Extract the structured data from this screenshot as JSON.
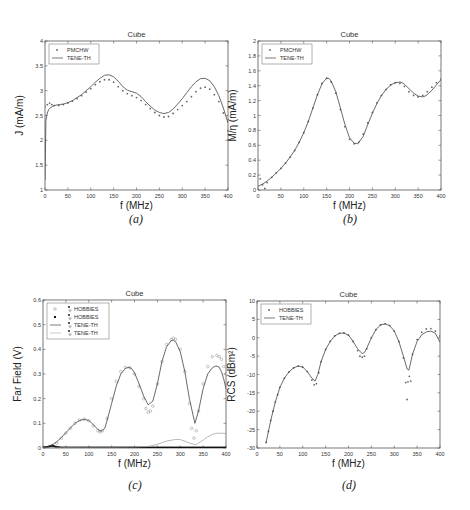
{
  "captions": [
    "(a)",
    "(b)",
    "(c)",
    "(d)"
  ],
  "chart_data": [
    {
      "id": "a",
      "type": "line",
      "title": "Cube",
      "xlabel": "f (MHz)",
      "ylabel": "J (mA/m)",
      "xlim": [
        0,
        400
      ],
      "ylim": [
        1,
        4
      ],
      "xticks": [
        0,
        50,
        100,
        150,
        200,
        250,
        300,
        350,
        400
      ],
      "yticks": [
        1,
        1.5,
        2,
        2.5,
        3,
        3.5,
        4
      ],
      "ytick_labels": [
        "1",
        "1.5",
        "2",
        "2.5",
        "3",
        "3.5",
        "4"
      ],
      "grid": false,
      "legend": {
        "position": "upper-left",
        "entries": [
          "PMCHW",
          "TENE-TH"
        ]
      },
      "series": [
        {
          "name": "PMCHW",
          "style": "markers",
          "x": [
            0,
            5,
            10,
            15,
            20,
            30,
            40,
            50,
            60,
            70,
            80,
            90,
            100,
            110,
            120,
            130,
            140,
            150,
            160,
            170,
            180,
            190,
            200,
            210,
            220,
            230,
            240,
            250,
            260,
            270,
            280,
            290,
            300,
            310,
            320,
            330,
            340,
            350,
            360,
            370,
            380,
            390,
            400
          ],
          "y": [
            2.68,
            2.72,
            2.75,
            2.72,
            2.7,
            2.7,
            2.72,
            2.75,
            2.79,
            2.84,
            2.9,
            2.97,
            3.04,
            3.12,
            3.18,
            3.22,
            3.22,
            3.17,
            3.08,
            3.0,
            2.94,
            2.9,
            2.86,
            2.8,
            2.72,
            2.64,
            2.56,
            2.5,
            2.47,
            2.48,
            2.54,
            2.62,
            2.7,
            2.78,
            2.88,
            2.98,
            3.05,
            3.07,
            3.03,
            2.92,
            2.78,
            2.55,
            2.2
          ]
        },
        {
          "name": "TENE-TH",
          "style": "line",
          "x": [
            0,
            2,
            5,
            8,
            12,
            16,
            20,
            30,
            40,
            50,
            60,
            70,
            80,
            90,
            100,
            110,
            120,
            130,
            140,
            150,
            160,
            170,
            180,
            190,
            200,
            210,
            220,
            230,
            240,
            250,
            260,
            270,
            280,
            290,
            300,
            310,
            320,
            330,
            340,
            350,
            360,
            370,
            380,
            390,
            400
          ],
          "y": [
            1.2,
            2.4,
            2.55,
            2.62,
            2.66,
            2.68,
            2.7,
            2.72,
            2.73,
            2.76,
            2.8,
            2.86,
            2.92,
            3.0,
            3.08,
            3.17,
            3.25,
            3.31,
            3.32,
            3.28,
            3.19,
            3.08,
            3.01,
            2.98,
            2.95,
            2.88,
            2.78,
            2.69,
            2.61,
            2.56,
            2.54,
            2.56,
            2.63,
            2.73,
            2.84,
            2.96,
            3.08,
            3.18,
            3.24,
            3.25,
            3.2,
            3.08,
            2.9,
            2.65,
            2.35
          ]
        }
      ]
    },
    {
      "id": "b",
      "type": "line",
      "title": "Cube",
      "xlabel": "f (MHz)",
      "ylabel": "M/η (mA/m)",
      "xlim": [
        0,
        400
      ],
      "ylim": [
        0,
        2
      ],
      "xticks": [
        0,
        50,
        100,
        150,
        200,
        250,
        300,
        350,
        400
      ],
      "yticks": [
        0,
        0.2,
        0.4,
        0.6,
        0.8,
        1,
        1.2,
        1.4,
        1.6,
        1.8,
        2
      ],
      "ytick_labels": [
        "0",
        "0.2",
        "0.4",
        "0.6",
        "0.8",
        "1",
        "1.2",
        "1.4",
        "1.6",
        "1.8",
        "2"
      ],
      "grid": false,
      "legend": {
        "position": "upper-left",
        "entries": [
          "PMCHW",
          "TENE-TH"
        ]
      },
      "series": [
        {
          "name": "PMCHW",
          "style": "markers",
          "x": [
            5,
            10,
            15,
            20,
            30,
            40,
            50,
            60,
            70,
            80,
            90,
            100,
            110,
            120,
            130,
            140,
            150,
            160,
            170,
            180,
            190,
            200,
            210,
            220,
            230,
            240,
            250,
            260,
            270,
            280,
            290,
            300,
            310,
            320,
            330,
            340,
            350,
            360,
            370,
            380,
            390,
            400
          ],
          "y": [
            0.15,
            0.07,
            0.02,
            0.1,
            0.17,
            0.23,
            0.29,
            0.36,
            0.44,
            0.53,
            0.64,
            0.77,
            0.92,
            1.1,
            1.28,
            1.43,
            1.5,
            1.45,
            1.3,
            1.08,
            0.85,
            0.68,
            0.62,
            0.64,
            0.75,
            0.9,
            1.04,
            1.17,
            1.27,
            1.35,
            1.41,
            1.44,
            1.43,
            1.39,
            1.32,
            1.27,
            1.25,
            1.27,
            1.32,
            1.38,
            1.44,
            1.49
          ]
        },
        {
          "name": "TENE-TH",
          "style": "line",
          "x": [
            0,
            10,
            20,
            30,
            40,
            50,
            60,
            70,
            80,
            90,
            100,
            110,
            120,
            130,
            140,
            150,
            155,
            160,
            170,
            180,
            190,
            200,
            210,
            218,
            230,
            240,
            250,
            260,
            270,
            280,
            290,
            300,
            310,
            315,
            320,
            330,
            340,
            350,
            360,
            365,
            370,
            380,
            390,
            400
          ],
          "y": [
            0.05,
            0.08,
            0.12,
            0.17,
            0.23,
            0.29,
            0.36,
            0.44,
            0.53,
            0.64,
            0.77,
            0.92,
            1.1,
            1.28,
            1.43,
            1.5,
            1.5,
            1.46,
            1.32,
            1.1,
            0.88,
            0.7,
            0.63,
            0.62,
            0.72,
            0.88,
            1.03,
            1.16,
            1.27,
            1.35,
            1.41,
            1.44,
            1.45,
            1.44,
            1.42,
            1.36,
            1.3,
            1.26,
            1.25,
            1.26,
            1.28,
            1.34,
            1.41,
            1.48
          ]
        }
      ]
    },
    {
      "id": "c",
      "type": "line",
      "title": "Cube",
      "xlabel": "f (MHz)",
      "ylabel": "Far Field (V)",
      "xlim": [
        0,
        400
      ],
      "ylim": [
        0,
        0.6
      ],
      "xticks": [
        0,
        50,
        100,
        150,
        200,
        250,
        300,
        350,
        400
      ],
      "yticks": [
        0,
        0.1,
        0.2,
        0.3,
        0.4,
        0.5,
        0.6
      ],
      "ytick_labels": [
        "0",
        "0.1",
        "0.2",
        "0.3",
        "0.4",
        "0.5",
        "0.6"
      ],
      "grid": false,
      "legend": {
        "position": "upper-left",
        "entries": [
          "HOBBIES",
          "HOBBIES",
          "TENE-TH",
          "TENE-TH"
        ]
      },
      "series": [
        {
          "name": "HOBBIES",
          "style": "open-markers",
          "x": [
            10,
            20,
            30,
            40,
            50,
            60,
            70,
            80,
            90,
            100,
            110,
            120,
            125,
            130,
            140,
            150,
            160,
            170,
            180,
            190,
            200,
            210,
            220,
            225,
            230,
            235,
            240,
            250,
            260,
            270,
            280,
            285,
            290,
            300,
            310,
            320,
            325,
            330,
            335,
            340,
            350,
            360,
            370,
            380,
            385,
            390,
            395,
            400
          ],
          "y": [
            0.0,
            0.01,
            0.02,
            0.04,
            0.06,
            0.08,
            0.1,
            0.113,
            0.117,
            0.11,
            0.09,
            0.07,
            0.065,
            0.07,
            0.12,
            0.2,
            0.27,
            0.31,
            0.327,
            0.325,
            0.3,
            0.25,
            0.2,
            0.16,
            0.145,
            0.15,
            0.17,
            0.26,
            0.35,
            0.42,
            0.44,
            0.445,
            0.44,
            0.4,
            0.31,
            0.18,
            0.08,
            0.04,
            0.07,
            0.15,
            0.26,
            0.33,
            0.37,
            0.375,
            0.37,
            0.36,
            0.33,
            0.3
          ]
        },
        {
          "name": "HOBBIES",
          "style": "filled-markers",
          "x": [
            0,
            10,
            20,
            30,
            40,
            50,
            60,
            70,
            80,
            90,
            100,
            110,
            120,
            130,
            140,
            150,
            160,
            170,
            180,
            190,
            200,
            210,
            220,
            230,
            240,
            250,
            260,
            270,
            280,
            290,
            300,
            310,
            320,
            330,
            340,
            350,
            360,
            370,
            380,
            390,
            400
          ],
          "y": [
            0.0,
            0.003,
            0.008,
            0.002,
            0.0,
            0.0,
            0.0,
            0.0,
            0.0,
            0.0,
            0.0,
            0.0,
            0.0,
            0.0,
            0.0,
            0.0,
            0.0,
            0.0,
            0.0,
            0.0,
            0.0,
            0.0,
            0.0,
            0.0,
            0.0,
            0.0,
            0.0,
            0.0,
            0.0,
            0.0,
            0.0,
            0.0,
            0.0,
            0.0,
            0.0,
            0.0,
            0.0,
            0.0,
            0.0,
            0.0,
            0.0
          ]
        },
        {
          "name": "TENE-TH",
          "style": "line",
          "x": [
            0,
            10,
            20,
            30,
            40,
            50,
            60,
            70,
            80,
            90,
            100,
            110,
            120,
            127,
            135,
            140,
            150,
            160,
            170,
            180,
            188,
            195,
            200,
            210,
            220,
            230,
            240,
            250,
            260,
            270,
            280,
            285,
            290,
            300,
            310,
            320,
            332,
            340,
            350,
            360,
            370,
            378,
            385,
            390,
            395,
            400
          ],
          "y": [
            0.0,
            0.005,
            0.012,
            0.025,
            0.042,
            0.062,
            0.082,
            0.1,
            0.112,
            0.116,
            0.112,
            0.095,
            0.075,
            0.068,
            0.08,
            0.11,
            0.18,
            0.25,
            0.3,
            0.323,
            0.327,
            0.32,
            0.305,
            0.26,
            0.21,
            0.175,
            0.19,
            0.26,
            0.35,
            0.41,
            0.435,
            0.437,
            0.43,
            0.39,
            0.31,
            0.2,
            0.1,
            0.15,
            0.24,
            0.3,
            0.325,
            0.333,
            0.328,
            0.31,
            0.28,
            0.24
          ]
        },
        {
          "name": "TENE-TH",
          "style": "thin-line",
          "x": [
            0,
            50,
            100,
            150,
            200,
            230,
            250,
            270,
            290,
            300,
            310,
            320,
            330,
            335,
            340,
            350,
            360,
            370,
            380,
            390,
            400
          ],
          "y": [
            0.0,
            0.002,
            0.003,
            0.003,
            0.004,
            0.006,
            0.015,
            0.028,
            0.035,
            0.034,
            0.028,
            0.02,
            0.015,
            0.014,
            0.02,
            0.032,
            0.045,
            0.055,
            0.06,
            0.06,
            0.058
          ]
        }
      ]
    },
    {
      "id": "d",
      "type": "line",
      "title": "Cube",
      "xlabel": "f (MHz)",
      "ylabel": "RCS (dBm²)",
      "xlim": [
        0,
        400
      ],
      "ylim": [
        -30,
        10
      ],
      "xticks": [
        0,
        50,
        100,
        150,
        200,
        250,
        300,
        350,
        400
      ],
      "yticks": [
        -30,
        -25,
        -20,
        -15,
        -10,
        -5,
        0,
        5,
        10
      ],
      "ytick_labels": [
        "-30",
        "-25",
        "-20",
        "-15",
        "-10",
        "-5",
        "0",
        "5",
        "10"
      ],
      "grid": false,
      "legend": {
        "position": "upper-left",
        "entries": [
          "HOBBIES",
          "TENE-TH"
        ]
      },
      "series": [
        {
          "name": "HOBBIES",
          "style": "markers",
          "x": [
            20,
            25,
            30,
            35,
            40,
            45,
            50,
            60,
            70,
            80,
            90,
            100,
            110,
            120,
            125,
            130,
            135,
            140,
            150,
            160,
            170,
            180,
            190,
            200,
            210,
            220,
            225,
            230,
            235,
            240,
            250,
            260,
            270,
            280,
            290,
            300,
            310,
            320,
            325,
            328,
            330,
            333,
            336,
            340,
            350,
            360,
            370,
            380,
            390,
            400
          ],
          "y": [
            -28.5,
            -25.5,
            -22.5,
            -20,
            -17.5,
            -15.5,
            -13.5,
            -11,
            -9.3,
            -8.2,
            -7.7,
            -8,
            -9.2,
            -11.5,
            -12.8,
            -12.5,
            -9.5,
            -6.5,
            -3.2,
            -1.0,
            0.5,
            1.2,
            1.3,
            0.7,
            -1.0,
            -3.5,
            -5.0,
            -5.3,
            -5.0,
            -3.0,
            0.0,
            2.2,
            3.5,
            3.8,
            3.3,
            1.8,
            -1.0,
            -5.5,
            -12.2,
            -16.8,
            -12.0,
            -10.5,
            -11.8,
            -4.5,
            -0.5,
            1.5,
            2.4,
            2.5,
            1.8,
            0.5
          ]
        },
        {
          "name": "TENE-TH",
          "style": "line",
          "x": [
            20,
            25,
            30,
            35,
            40,
            45,
            50,
            60,
            70,
            80,
            90,
            100,
            110,
            120,
            127,
            133,
            140,
            150,
            160,
            170,
            180,
            190,
            200,
            210,
            220,
            230,
            235,
            240,
            250,
            260,
            270,
            280,
            290,
            300,
            310,
            320,
            328,
            332,
            340,
            350,
            360,
            370,
            380,
            390,
            400
          ],
          "y": [
            -28.5,
            -25.5,
            -22.5,
            -20,
            -17.5,
            -15.5,
            -13.5,
            -11,
            -9.3,
            -8.2,
            -7.7,
            -8,
            -9.2,
            -11,
            -11.8,
            -10,
            -6.5,
            -3.2,
            -1.0,
            0.5,
            1.2,
            1.3,
            0.7,
            -1.0,
            -3.0,
            -4.3,
            -4.0,
            -2.8,
            0.0,
            2.2,
            3.5,
            3.8,
            3.3,
            1.8,
            -1.0,
            -5.0,
            -8.5,
            -8.8,
            -4.5,
            -1.0,
            0.8,
            1.6,
            1.8,
            1.2,
            -1.2
          ]
        }
      ]
    }
  ]
}
